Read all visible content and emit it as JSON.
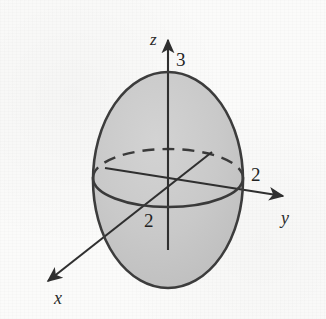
{
  "figure": {
    "kind": "3d-ellipsoid-sketch",
    "caption": "Ellipsoid centered at the origin with x-, y-, and z-axes",
    "background_color": "#fbfbfa",
    "surface_fill_color": "#c9c9c9",
    "outline_color": "#3c3c3c",
    "axis_color": "#2f2f2f"
  },
  "axes": [
    {
      "id": "z",
      "label": "z",
      "label_style": "italic",
      "direction": "up",
      "intercept_label": "3",
      "line": {
        "x1": 168,
        "y1": 250,
        "x2": 168,
        "y2": 40
      },
      "arrow_tip": {
        "x": 168,
        "y": 33
      }
    },
    {
      "id": "y",
      "label": "y",
      "label_style": "italic",
      "direction": "right",
      "intercept_label": "2",
      "line": {
        "x1": 105,
        "y1": 168,
        "x2": 283,
        "y2": 196
      },
      "arrow_tip": {
        "x": 292,
        "y": 197
      }
    },
    {
      "id": "x",
      "label": "x",
      "label_style": "italic",
      "direction": "lower-left",
      "intercept_label": "2",
      "line": {
        "x1": 212,
        "y1": 152,
        "x2": 48,
        "y2": 281
      },
      "arrow_tip": {
        "x": 39,
        "y": 288
      }
    }
  ],
  "labels": {
    "z_axis": {
      "text": "z",
      "x": 150,
      "y": 31
    },
    "z_intercept": {
      "text": "3",
      "x": 176,
      "y": 50
    },
    "y_axis": {
      "text": "y",
      "x": 281,
      "y": 209
    },
    "y_intercept": {
      "text": "2",
      "x": 251,
      "y": 165
    },
    "x_axis": {
      "text": "x",
      "x": 54,
      "y": 289
    },
    "x_intercept": {
      "text": "2",
      "x": 144,
      "y": 211
    }
  },
  "ellipsoid": {
    "center": {
      "x": 168,
      "y": 180
    },
    "radius_x": 75,
    "radius_y": 108,
    "semi_axis_values": {
      "x": 2,
      "y": 2,
      "z": 3
    }
  },
  "equator": {
    "center": {
      "x": 168,
      "y": 178
    },
    "radius_x": 75,
    "radius_y": 29,
    "front_half": "solid",
    "back_half": "dashed"
  }
}
